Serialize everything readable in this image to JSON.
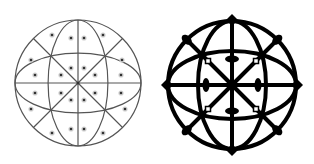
{
  "figures": [
    {
      "name": "thin-line-star-of-life-grid",
      "cx": 78,
      "cy": 83,
      "r": 63,
      "stroke_color": "#555555",
      "stroke_width": 1.2,
      "dot_color": "#333333",
      "dot_count": 32
    },
    {
      "name": "bold-line-seed-pattern",
      "cx": 232,
      "cy": 85,
      "r": 66,
      "stroke_color": "#000000",
      "stroke_width": 4,
      "node_color": "#000000"
    }
  ],
  "colors": {
    "background": "#ffffff"
  }
}
